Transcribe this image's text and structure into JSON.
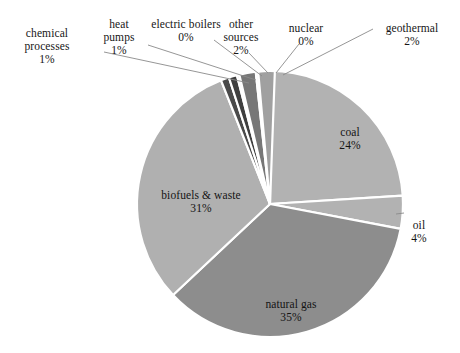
{
  "chart_data": {
    "type": "pie",
    "title": "",
    "subtitle": "",
    "xlabel": "",
    "ylabel": "",
    "legend_position": "none",
    "grid": false,
    "labels_show_percent": true,
    "categories": [
      "natural gas",
      "biofuels & waste",
      "coal",
      "oil",
      "geothermal",
      "other sources",
      "chemical processes",
      "heat pumps",
      "electric boilers",
      "nuclear"
    ],
    "values": [
      35,
      31,
      24,
      4,
      2,
      2,
      1,
      1,
      0,
      0
    ],
    "slices": [
      {
        "name": "coal",
        "value": 24,
        "percent_text": "24%",
        "color": "#b2b2b2",
        "label_placement": "inside",
        "label_x": 350,
        "label_y": 126
      },
      {
        "name": "oil",
        "value": 4,
        "percent_text": "4%",
        "color": "#b2b2b2",
        "label_placement": "outside",
        "label_x": 419,
        "label_y": 219
      },
      {
        "name": "natural gas",
        "value": 35,
        "percent_text": "35%",
        "color": "#8d8d8d",
        "label_placement": "inside",
        "label_x": 291,
        "label_y": 298
      },
      {
        "name": "biofuels & waste",
        "value": 31,
        "percent_text": "31%",
        "color": "#b0b0b0",
        "label_placement": "inside",
        "label_x": 201,
        "label_y": 189
      },
      {
        "name": "chemical processes",
        "value": 1,
        "percent_text": "1%",
        "color": "#4a4a4a",
        "label_placement": "outside",
        "label_x": 47,
        "label_y": 27
      },
      {
        "name": "heat pumps",
        "value": 1,
        "percent_text": "1%",
        "color": "#3f3f3f",
        "label_placement": "outside",
        "label_x": 119,
        "label_y": 18
      },
      {
        "name": "electric boilers",
        "value": 0,
        "percent_text": "0%",
        "color": "#d8d8d8",
        "label_placement": "outside",
        "label_x": 186,
        "label_y": 18
      },
      {
        "name": "other sources",
        "value": 2,
        "percent_text": "2%",
        "color": "#777777",
        "label_placement": "outside",
        "label_x": 241,
        "label_y": 18
      },
      {
        "name": "nuclear",
        "value": 0,
        "percent_text": "0%",
        "color": "#d8d8d8",
        "label_placement": "outside",
        "label_x": 306,
        "label_y": 22
      },
      {
        "name": "geothermal",
        "value": 2,
        "percent_text": "2%",
        "color": "#a0a0a0",
        "label_placement": "outside",
        "label_x": 412,
        "label_y": 22
      }
    ],
    "geometry": {
      "center_x": 270,
      "center_y": 204,
      "radius": 133,
      "start_angle_deg": -90,
      "direction": "clockwise",
      "separator_color": "#ffffff",
      "separator_width": 2.2
    },
    "leader_lines": [
      {
        "name": "chemical-processes-leader",
        "x1": 104,
        "y1": 52,
        "x2": 249,
        "y2": 83
      },
      {
        "name": "heat-pumps-leader",
        "x1": 148,
        "y1": 45,
        "x2": 256,
        "y2": 80
      },
      {
        "name": "electric-boilers-leader",
        "x1": 214,
        "y1": 40,
        "x2": 262,
        "y2": 76
      },
      {
        "name": "other-sources-leader",
        "x1": 249,
        "y1": 53,
        "x2": 268,
        "y2": 73
      },
      {
        "name": "nuclear-leader",
        "x1": 299,
        "y1": 44,
        "x2": 276,
        "y2": 73
      },
      {
        "name": "geothermal-leader",
        "x1": 373,
        "y1": 29,
        "x2": 283,
        "y2": 75
      },
      {
        "name": "oil-leader",
        "x1": 404,
        "y1": 213,
        "x2": 396,
        "y2": 214
      }
    ]
  }
}
